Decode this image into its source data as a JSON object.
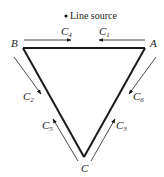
{
  "diagram": {
    "type": "line-source triangle loop",
    "source_label": "Line source",
    "vertices": [
      {
        "id": "A",
        "label": "A"
      },
      {
        "id": "B",
        "label": "B"
      },
      {
        "id": "C",
        "label": "C"
      }
    ],
    "edges": [
      {
        "from": "B",
        "to": "A"
      },
      {
        "from": "B",
        "to": "C"
      },
      {
        "from": "A",
        "to": "C"
      }
    ],
    "currents": [
      {
        "name": "C",
        "sub": "1",
        "along": "A to B (top, pointing left)"
      },
      {
        "name": "C",
        "sub": "2",
        "along": "B to C (left, pointing down)"
      },
      {
        "name": "C",
        "sub": "3",
        "along": "C to A (right, pointing up)"
      },
      {
        "name": "C",
        "sub": "4",
        "along": "B to A (top, pointing right)"
      },
      {
        "name": "C",
        "sub": "5",
        "along": "C to B (left, pointing up)"
      },
      {
        "name": "C",
        "sub": "6",
        "along": "A to C (right, pointing down)"
      }
    ],
    "colors": {
      "line": "#1a1a1a",
      "background": "#ffffff"
    }
  }
}
